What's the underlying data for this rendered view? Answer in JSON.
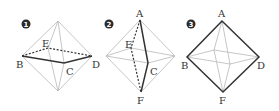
{
  "figure": {
    "panels": [
      {
        "number": "1",
        "labels": {
          "E": "E",
          "B": "B",
          "C": "C",
          "D": "D"
        },
        "highlighted_path": "B-C-D (solid), B-E-D (dashed)"
      },
      {
        "number": "2",
        "labels": {
          "A": "A",
          "E": "E",
          "C": "C",
          "F": "F"
        },
        "highlighted_path": "A-C-F (solid), A-E-F (dotted)"
      },
      {
        "number": "3",
        "labels": {
          "A": "A",
          "B": "B",
          "D": "D",
          "F": "F"
        },
        "highlighted_path": "A-B-F-D-A (solid)"
      }
    ]
  }
}
